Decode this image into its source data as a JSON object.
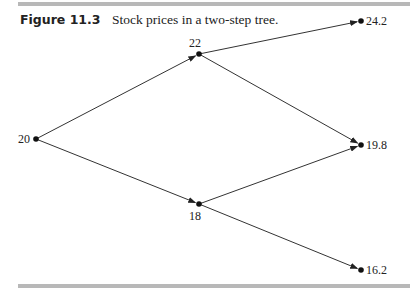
{
  "caption": {
    "figure_label": "Figure 11.3",
    "text": "Stock prices in a two-step tree."
  },
  "tree": {
    "nodes": [
      {
        "id": "root",
        "label": "20",
        "x": 36,
        "y": 139
      },
      {
        "id": "up",
        "label": "22",
        "x": 199,
        "y": 54
      },
      {
        "id": "down",
        "label": "18",
        "x": 199,
        "y": 204
      },
      {
        "id": "uu",
        "label": "24.2",
        "x": 361,
        "y": 21
      },
      {
        "id": "ud",
        "label": "19.8",
        "x": 361,
        "y": 145
      },
      {
        "id": "dd",
        "label": "16.2",
        "x": 361,
        "y": 270
      }
    ],
    "edges": [
      {
        "from": "root",
        "to": "up"
      },
      {
        "from": "root",
        "to": "down"
      },
      {
        "from": "up",
        "to": "uu"
      },
      {
        "from": "up",
        "to": "ud"
      },
      {
        "from": "down",
        "to": "ud"
      },
      {
        "from": "down",
        "to": "dd"
      }
    ]
  }
}
